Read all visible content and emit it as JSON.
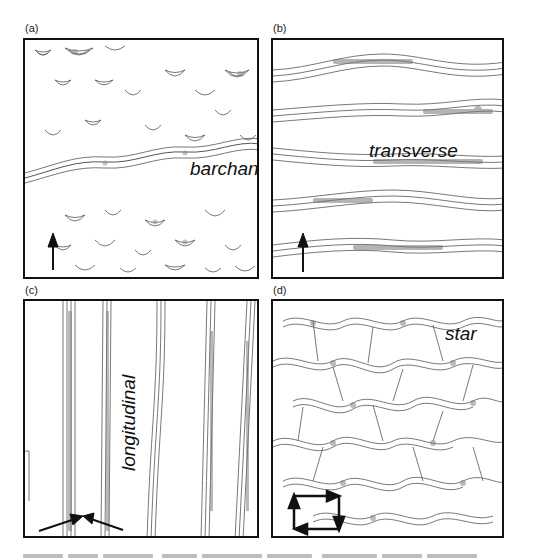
{
  "figure": {
    "panels": [
      {
        "id": "a",
        "label": "(a)",
        "dune_type": "barchan",
        "wind_arrows": [
          {
            "direction": "up",
            "description": "single arrow pointing north (unidirectional wind)"
          }
        ]
      },
      {
        "id": "b",
        "label": "(b)",
        "dune_type": "transverse",
        "wind_arrows": [
          {
            "direction": "up",
            "description": "single arrow pointing north"
          }
        ]
      },
      {
        "id": "c",
        "label": "(c)",
        "dune_type": "longitudinal",
        "wind_arrows": [
          {
            "direction": "converging",
            "description": "two arrows converging from lower-left and lower-right (bimodal wind)"
          }
        ]
      },
      {
        "id": "d",
        "label": "(d)",
        "dune_type": "star",
        "wind_arrows": [
          {
            "direction": "rotating",
            "description": "four arrows forming a square circuit: up, right, down, left (multidirectional wind)"
          }
        ]
      }
    ],
    "caption": {
      "text": "",
      "legible": false
    }
  },
  "colors": {
    "ink": "#111111",
    "contour": "#555555",
    "shading": "#888888",
    "background": "#ffffff"
  }
}
